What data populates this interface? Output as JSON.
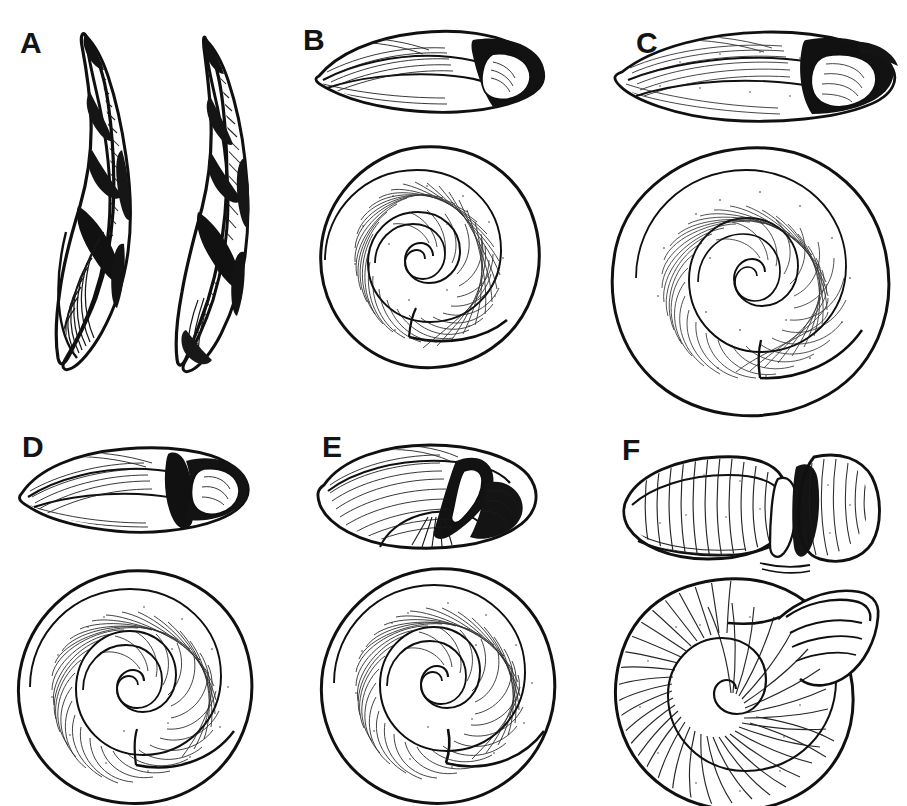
{
  "figure": {
    "type": "scientific-illustration-plate",
    "background_color": "#ffffff",
    "ink_color": "#101010",
    "width": 907,
    "height": 806,
    "rows": 2,
    "columns": 3,
    "label_style": "bold uppercase letter",
    "label_font_size_px": 30
  },
  "panels": [
    {
      "label": "A",
      "label_x": 20,
      "label_y": 28,
      "views": [
        "lateral-view-left",
        "lateral-view-right"
      ],
      "shell_form": "fusiform-sinistral-spindle",
      "specimen_count": 2,
      "description": "Two elongate spindle-shaped shells with twisted helical whorls; left specimen shows a heavily shaded aperture at the base.",
      "has_spiral_view": false
    },
    {
      "label": "B",
      "label_x": 303,
      "label_y": 25,
      "views": [
        "apertural-edge-view",
        "apical-spiral-view"
      ],
      "shell_form": "depressed-lenticular",
      "specimen_count": 1,
      "description": "Flattened lens-shaped shell; edge view above with dark aperture at right, spiral view below with fine radial growth lines.",
      "has_spiral_view": true,
      "spiral_whorls": 4.5
    },
    {
      "label": "C",
      "label_x": 636,
      "label_y": 28,
      "views": [
        "apertural-edge-view",
        "apical-spiral-view"
      ],
      "shell_form": "broadly-depressed",
      "specimen_count": 1,
      "description": "Broad flattened shell; edge view above elongate with dark aperture at right, large spiral view below with dense radial striae and stippling.",
      "has_spiral_view": true,
      "spiral_whorls": 5
    },
    {
      "label": "D",
      "label_x": 22,
      "label_y": 432,
      "views": [
        "apertural-edge-view",
        "apical-spiral-view"
      ],
      "shell_form": "depressed-elongate",
      "specimen_count": 1,
      "description": "Elongate flattened edge view with dark band at the aperture lip; tightly coiled spiral view below showing whorl sutures.",
      "has_spiral_view": true,
      "spiral_whorls": 5
    },
    {
      "label": "E",
      "label_x": 322,
      "label_y": 432,
      "views": [
        "apertural-edge-view",
        "apical-spiral-view"
      ],
      "shell_form": "globose-depressed",
      "specimen_count": 1,
      "description": "Short rounded oval edge view with crescent-shaped dark aperture at right; spiral view below with flared body whorl.",
      "has_spiral_view": true,
      "spiral_whorls": 4.5
    },
    {
      "label": "F",
      "label_x": 622,
      "label_y": 435,
      "views": [
        "apertural-edge-view",
        "apical-spiral-view"
      ],
      "shell_form": "cylindrical-ribbed",
      "specimen_count": 1,
      "description": "Blunt cylindrical edge view with transverse ribbing and projecting aperture flange; spiral view below with strong radial ribs and a flared, detached aperture.",
      "has_spiral_view": true,
      "spiral_whorls": 4
    }
  ]
}
